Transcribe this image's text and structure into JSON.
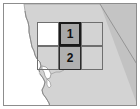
{
  "figure": {
    "kind": "locator-map",
    "region_label": "Northern California",
    "frame_color": "#8d8d8d",
    "background_color": "#ffffff"
  },
  "map": {
    "land_fill": "#d0d0d0",
    "land_stroke": "#9a9a9a",
    "ocean_fill": "#ffffff",
    "inland_state_fill": "#c9c9c9",
    "bay_fill": "#ffffff",
    "coastline_name": "pacific-coastline",
    "bay_name": "san-francisco-bay",
    "state_border_name": "california-nevada-border"
  },
  "study_boxes": [
    {
      "id": "box-1",
      "label": "1",
      "fill": "#a8a8a8",
      "stroke": "#1a1a1a",
      "x": 55,
      "y": 18,
      "width": 22,
      "height": 24
    },
    {
      "id": "box-2",
      "label": "2",
      "fill": "#b0b0b0",
      "stroke": "#2b2b2b",
      "x": 55,
      "y": 42,
      "width": 22,
      "height": 24
    }
  ],
  "outline_boxes": [
    {
      "id": "outline-upper-left",
      "x": 33,
      "y": 18,
      "width": 22,
      "height": 24,
      "stroke": "#6f6f6f",
      "fill": "#ffffff"
    },
    {
      "id": "outline-lower-right",
      "x": 77,
      "y": 42,
      "width": 22,
      "height": 24,
      "stroke": "#6f6f6f",
      "fill": "transparent"
    },
    {
      "id": "outline-upper-right",
      "x": 77,
      "y": 18,
      "width": 22,
      "height": 24,
      "stroke": "#6f6f6f",
      "fill": "transparent"
    },
    {
      "id": "outline-lower-left",
      "x": 33,
      "y": 42,
      "width": 22,
      "height": 24,
      "stroke": "#6f6f6f",
      "fill": "transparent"
    }
  ]
}
